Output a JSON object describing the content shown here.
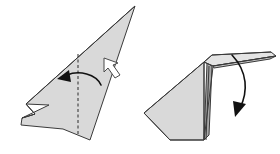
{
  "figure": {
    "step_count": 2,
    "background_color": "#ffffff",
    "colors": {
      "paper_light": "#d9d9d9",
      "paper_mid": "#cccccc",
      "paper_dark": "#a8a8a8",
      "paper_pale": "#e4e4e4",
      "outline": "#3a3a3a",
      "crease_dashed": "#2b2b2b",
      "arrow": "#111111",
      "push_arrow_fill": "#ffffff",
      "push_arrow_stroke": "#4a4a4a"
    }
  },
  "steps": [
    {
      "id": "step-left",
      "label": "",
      "shape_name": "folded-paper-triangle-left",
      "faces": [
        {
          "name": "main-triangle-face",
          "points": "135,6 90,140 63,129 21,125 22,118 35,114 26,104",
          "fill": "#d9d9d9"
        },
        {
          "name": "lower-left-flap-face",
          "points": "22,118 35,114 26,104 49,105",
          "fill": "#ffffff"
        }
      ],
      "creases": [
        {
          "name": "upper-edge-crease",
          "d": "M135,6 L26,104",
          "style": "solid"
        },
        {
          "name": "left-tip-crease",
          "d": "M26,104 L35,114 L22,118",
          "style": "solid"
        },
        {
          "name": "center-valley-crease",
          "d": "M78,54 L78,135",
          "style": "dashed"
        }
      ],
      "fold_arrow": {
        "name": "fold-left-arrow",
        "path": "M101,85 C96,74 79,70 67,75",
        "head_points": "69,70 57,79 71,82",
        "direction": "left"
      },
      "push_arrow": {
        "name": "push-here-arrow",
        "points": "104,58 104,72 108,68 115,78 120,75 113,65 118,63",
        "direction": "up-left"
      }
    },
    {
      "id": "step-right",
      "label": "",
      "shape_name": "folded-paper-triangle-right-with-raised-flap",
      "faces": [
        {
          "name": "main-body-face",
          "points": "204,62 203,140 170,140 144,113 204,62",
          "fill": "#d9d9d9"
        },
        {
          "name": "left-large-face",
          "points": "204,62 204,140 170,140 144,113",
          "fill": "#d9d9d9"
        },
        {
          "name": "right-dark-wedge-face",
          "points": "207,63 212,66 209,135 204,140",
          "fill": "#a8a8a8"
        },
        {
          "name": "top-raised-flap-face",
          "points": "204,62 212,55 271,52 276,56 213,66",
          "fill": "#e4e4e4"
        },
        {
          "name": "flap-tip-face",
          "points": "213,66 276,56 270,59 214,68",
          "fill": "#c4c4c4"
        },
        {
          "name": "inner-crease-face",
          "points": "212,66 250,60 230,78 212,92",
          "fill": "#d0d0d0"
        }
      ],
      "creases": [
        {
          "name": "body-outline",
          "d": "M204,62 L204,140 L170,140 L144,113 Z",
          "style": "solid"
        },
        {
          "name": "flap-fold-edge",
          "d": "M204,62 L212,55 L271,52",
          "style": "solid"
        },
        {
          "name": "flap-lower-edge",
          "d": "M213,66 L276,56",
          "style": "solid"
        },
        {
          "name": "flap-left-edge",
          "d": "M204,62 L213,66",
          "style": "solid"
        },
        {
          "name": "spine-crease",
          "d": "M209,66 L206,140",
          "style": "solid"
        },
        {
          "name": "diagonal-crease",
          "d": "M213,67 L204,140",
          "style": "solid"
        }
      ],
      "fold_arrow": {
        "name": "fold-down-arrow",
        "path": "M232,55 C248,72 248,92 240,108",
        "head_points": "246,104 235,117 233,101",
        "direction": "down"
      },
      "push_arrow": null
    }
  ]
}
